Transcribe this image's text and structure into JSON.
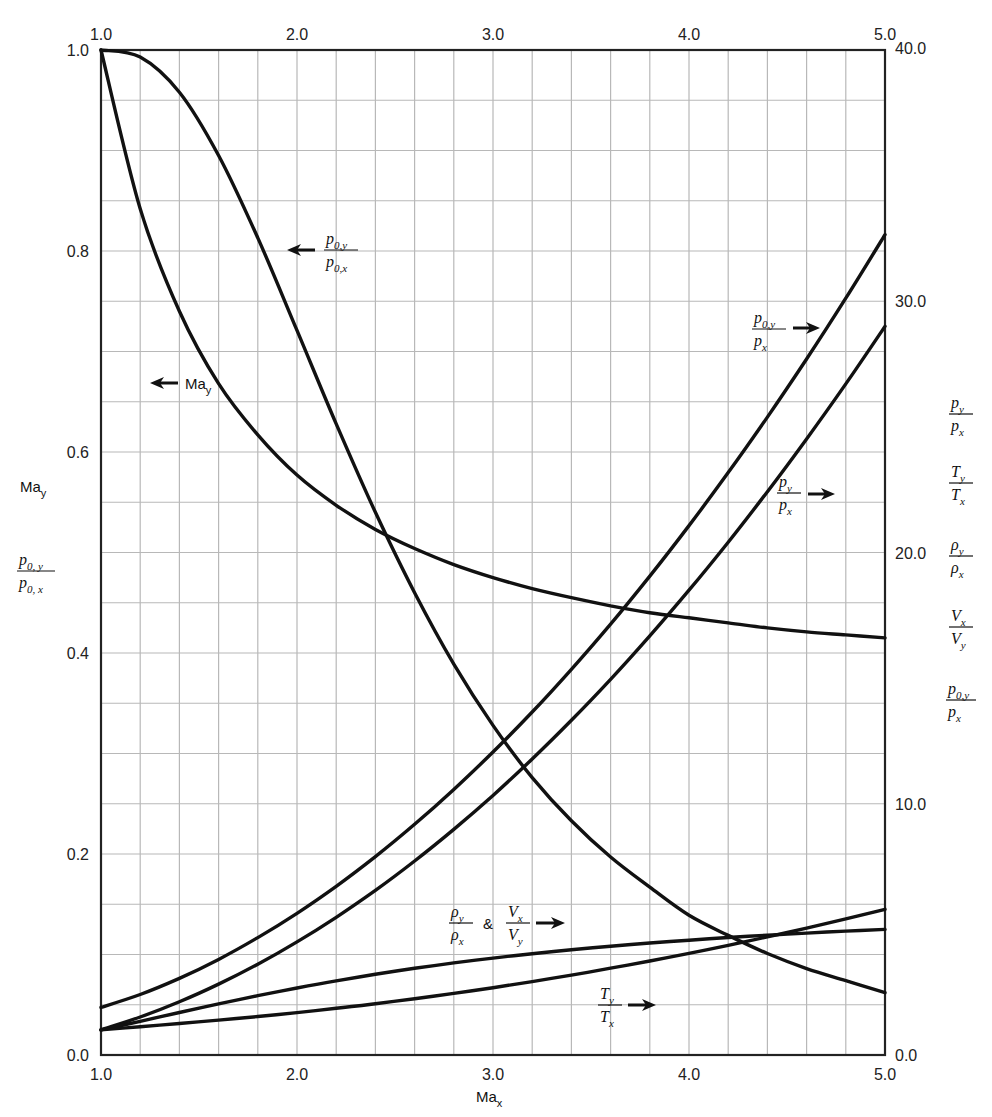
{
  "chart_data": {
    "type": "line",
    "title": "",
    "xlabel": "Ma_x",
    "ylabel_left": [
      "Ma_y",
      "p_{0,y}/p_{0,x}"
    ],
    "ylabel_right": [
      "p_y/p_x",
      "T_y/T_x",
      "ρ_y/ρ_x",
      "V_x/V_y",
      "p_{0,y}/p_x"
    ],
    "xlim": [
      1.0,
      5.0
    ],
    "ylim_left": [
      0.0,
      1.0
    ],
    "ylim_right": [
      0.0,
      40.0
    ],
    "grid": true,
    "x_ticks_bottom": [
      "1.0",
      "2.0",
      "3.0",
      "4.0",
      "5.0"
    ],
    "x_ticks_top": [
      "1.0",
      "2.0",
      "3.0",
      "4.0",
      "5.0"
    ],
    "y_ticks_left": [
      "0.0",
      "0.2",
      "0.4",
      "0.6",
      "0.8",
      "1.0"
    ],
    "y_ticks_right": [
      "0.0",
      "10.0",
      "20.0",
      "30.0",
      "40.0"
    ],
    "x": [
      1.0,
      1.2,
      1.4,
      1.6,
      1.8,
      2.0,
      2.2,
      2.4,
      2.6,
      2.8,
      3.0,
      3.2,
      3.4,
      3.6,
      3.8,
      4.0,
      4.2,
      4.4,
      4.6,
      4.8,
      5.0
    ],
    "series": [
      {
        "name": "Ma_y",
        "axis": "left",
        "values": [
          1.0,
          0.842,
          0.74,
          0.668,
          0.617,
          0.577,
          0.547,
          0.523,
          0.504,
          0.488,
          0.475,
          0.464,
          0.455,
          0.447,
          0.44,
          0.435,
          0.43,
          0.425,
          0.421,
          0.418,
          0.415
        ]
      },
      {
        "name": "p_{0,y}/p_{0,x}",
        "axis": "left",
        "values": [
          1.0,
          0.993,
          0.958,
          0.895,
          0.813,
          0.721,
          0.628,
          0.54,
          0.46,
          0.389,
          0.328,
          0.276,
          0.233,
          0.197,
          0.167,
          0.139,
          0.119,
          0.101,
          0.086,
          0.074,
          0.062
        ]
      },
      {
        "name": "p_{0,y}/p_x",
        "axis": "right",
        "values": [
          1.893,
          2.408,
          3.049,
          3.805,
          4.672,
          5.64,
          6.716,
          7.896,
          9.181,
          10.57,
          12.06,
          13.65,
          15.35,
          17.15,
          19.06,
          21.07,
          23.18,
          25.39,
          27.7,
          30.12,
          32.65
        ]
      },
      {
        "name": "p_y/p_x",
        "axis": "right",
        "values": [
          1.0,
          1.513,
          2.12,
          2.82,
          3.613,
          4.5,
          5.48,
          6.553,
          7.72,
          8.98,
          10.33,
          11.78,
          13.32,
          14.95,
          16.68,
          18.5,
          20.41,
          22.42,
          24.52,
          26.71,
          29.0
        ]
      },
      {
        "name": "ρ_y/ρ_x & V_x/V_y",
        "axis": "right",
        "values": [
          1.0,
          1.342,
          1.69,
          2.032,
          2.359,
          2.667,
          2.951,
          3.212,
          3.449,
          3.664,
          3.857,
          4.031,
          4.188,
          4.33,
          4.457,
          4.571,
          4.675,
          4.768,
          4.853,
          4.93,
          5.0
        ]
      },
      {
        "name": "T_y/T_x",
        "axis": "right",
        "values": [
          1.0,
          1.128,
          1.255,
          1.388,
          1.532,
          1.688,
          1.857,
          2.04,
          2.238,
          2.451,
          2.679,
          2.922,
          3.18,
          3.454,
          3.743,
          4.047,
          4.367,
          4.702,
          5.052,
          5.418,
          5.8
        ]
      }
    ],
    "annotations": [
      {
        "text": "p_{0,y}/p_{0,x}",
        "arrow": "left",
        "x": 2.0,
        "y_left": 0.8
      },
      {
        "text": "Ma_y",
        "arrow": "left",
        "x": 1.3,
        "y_left": 0.67
      },
      {
        "text": "p_{0,y}/p_x",
        "arrow": "right",
        "x": 4.1,
        "y_right": 29.0
      },
      {
        "text": "p_y/p_x",
        "arrow": "right",
        "x": 4.4,
        "y_right": 21.8
      },
      {
        "text": "ρ_y/ρ_x & V_x/V_y",
        "arrow": "right",
        "x": 3.3,
        "y_right": 6.8
      },
      {
        "text": "T_y/T_x",
        "arrow": "right",
        "x": 3.9,
        "y_right": 2.3
      }
    ]
  },
  "labels": {
    "x_axis_title": "Ma",
    "x_axis_sub": "x",
    "left_may": "Ma",
    "left_may_sub": "y",
    "p0_num": "p",
    "p0_num_sub": "0, y",
    "p0_den": "p",
    "p0_den_sub": "0, x",
    "ann_p0_num_sub": "0,y",
    "ann_p0_den_sub": "0,x",
    "amp": "&"
  }
}
